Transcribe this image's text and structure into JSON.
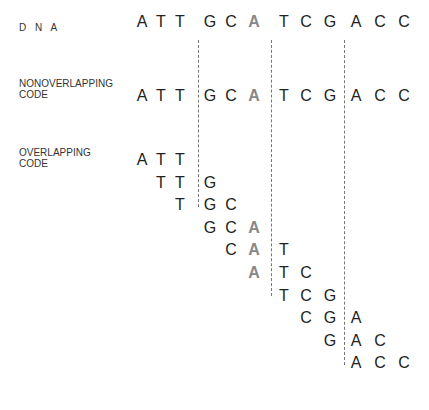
{
  "labels": {
    "dna": "D N A",
    "nonoverlapping": [
      "NONOVERLAPPING",
      "CODE"
    ],
    "overlapping": [
      "OVERLAPPING",
      "CODE"
    ]
  },
  "colors": {
    "base": "#222222",
    "highlight": "#888888",
    "divider": "#777777"
  },
  "sequence": [
    "A",
    "T",
    "T",
    "G",
    "C",
    "A",
    "T",
    "C",
    "G",
    "A",
    "C",
    "C"
  ],
  "highlight_index": 5,
  "column_x": [
    142,
    161,
    180,
    210,
    231,
    254,
    284,
    306,
    330,
    356,
    380,
    404
  ],
  "rows": {
    "dna_y": 13,
    "nonoverlap_y": 87,
    "overlap_start_y": 151,
    "overlap_step": 22.6
  },
  "overlapping_triplets": [
    [
      "A",
      "T",
      "T"
    ],
    [
      "T",
      "T",
      "G"
    ],
    [
      "T",
      "G",
      "C"
    ],
    [
      "G",
      "C",
      "A"
    ],
    [
      "C",
      "A",
      "T"
    ],
    [
      "A",
      "T",
      "C"
    ],
    [
      "T",
      "C",
      "G"
    ],
    [
      "C",
      "G",
      "A"
    ],
    [
      "G",
      "A",
      "C"
    ],
    [
      "A",
      "C",
      "C"
    ]
  ],
  "dividers": [
    {
      "x": 198,
      "y1": 40,
      "y2": 207
    },
    {
      "x": 271,
      "y1": 40,
      "y2": 296
    },
    {
      "x": 344,
      "y1": 40,
      "y2": 365
    }
  ]
}
